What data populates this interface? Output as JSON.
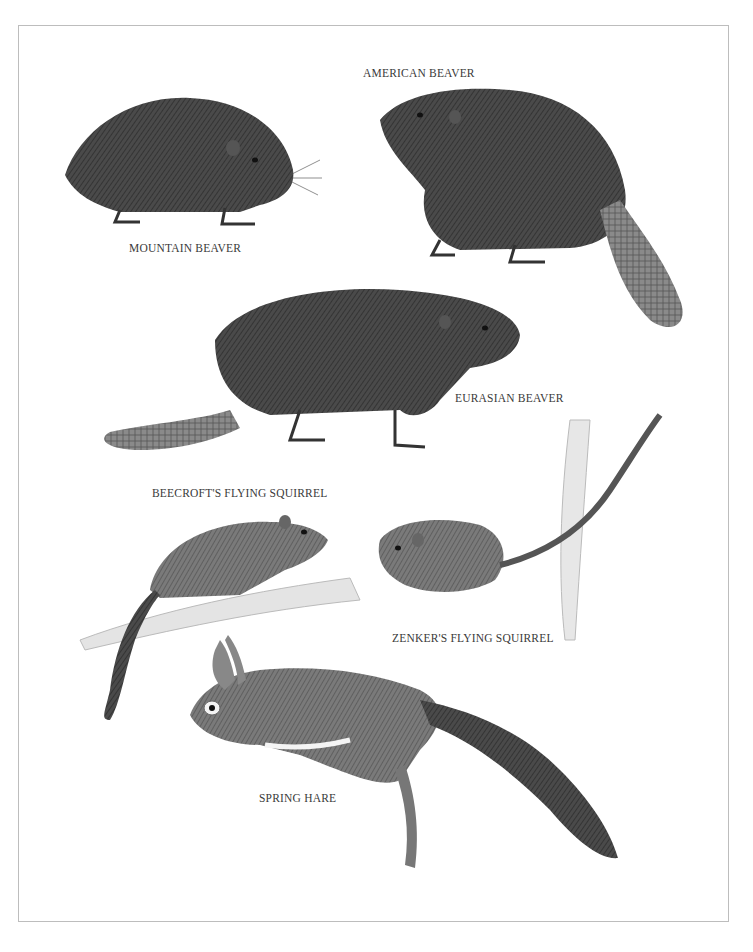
{
  "plate": {
    "type": "natural-history-illustration",
    "style": "graphite pencil drawing on white",
    "colors": {
      "background": "#ffffff",
      "frame": "#bdbdbd",
      "ink": "#2a2a2a",
      "label": "#3a3a3a"
    }
  },
  "labels": {
    "american_beaver": "AMERICAN BEAVER",
    "mountain_beaver": "MOUNTAIN BEAVER",
    "eurasian_beaver": "EURASIAN BEAVER",
    "beecrofts_flying_squirrel": "BEECROFT'S FLYING SQUIRREL",
    "zenkers_flying_squirrel": "ZENKER'S FLYING SQUIRREL",
    "spring_hare": "SPRING HARE"
  }
}
